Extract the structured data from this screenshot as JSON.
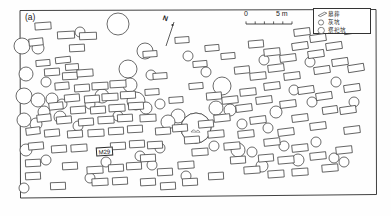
{
  "figure": {
    "panel_label": "(a)",
    "type": "archaeological-site-plan"
  },
  "north_arrow": {
    "label": "N",
    "name": "north-arrow"
  },
  "scale_bar": {
    "start_label": "0",
    "end_label": "5 m",
    "units": "m",
    "length_value": 5
  },
  "legend": {
    "items": [
      {
        "symbol": "rectangle",
        "label": "墓葬"
      },
      {
        "symbol": "circle-small",
        "label": "灰坑"
      },
      {
        "symbol": "circle-large",
        "label": "祭祀坑"
      }
    ]
  },
  "annotations": [
    {
      "id": "M29",
      "label": "M29"
    }
  ],
  "colors": {
    "stroke": "#3a3a3a",
    "frame": "#2b2b2b",
    "fill": "#ffffff",
    "background": "#fefefe",
    "hatch": "#555555"
  },
  "chart_data": {
    "type": "map",
    "title": "",
    "frame": {
      "x": 20,
      "y": 10,
      "width": 356,
      "height": 188
    },
    "tombs": [
      {
        "x": 43,
        "y": 26,
        "w": 16,
        "h": 7,
        "r": -4
      },
      {
        "x": 66,
        "y": 35,
        "w": 17,
        "h": 7,
        "r": -3
      },
      {
        "x": 88,
        "y": 36,
        "w": 17,
        "h": 7,
        "r": -2
      },
      {
        "x": 36,
        "y": 42,
        "w": 14,
        "h": 7,
        "r": -6
      },
      {
        "x": 77,
        "y": 48,
        "w": 15,
        "h": 7,
        "r": -3
      },
      {
        "x": 43,
        "y": 63,
        "w": 14,
        "h": 6,
        "r": -5
      },
      {
        "x": 63,
        "y": 60,
        "w": 15,
        "h": 6,
        "r": -6
      },
      {
        "x": 72,
        "y": 67,
        "w": 13,
        "h": 6,
        "r": -4
      },
      {
        "x": 52,
        "y": 72,
        "w": 15,
        "h": 7,
        "r": -4
      },
      {
        "x": 70,
        "y": 76,
        "w": 15,
        "h": 7,
        "r": -3
      },
      {
        "x": 85,
        "y": 73,
        "w": 16,
        "h": 7,
        "r": -4
      },
      {
        "x": 62,
        "y": 86,
        "w": 14,
        "h": 7,
        "r": -5
      },
      {
        "x": 82,
        "y": 88,
        "w": 15,
        "h": 7,
        "r": -4
      },
      {
        "x": 100,
        "y": 86,
        "w": 16,
        "h": 7,
        "r": -3
      },
      {
        "x": 118,
        "y": 84,
        "w": 16,
        "h": 7,
        "r": -3
      },
      {
        "x": 72,
        "y": 98,
        "w": 15,
        "h": 7,
        "r": -5
      },
      {
        "x": 92,
        "y": 99,
        "w": 15,
        "h": 7,
        "r": -4
      },
      {
        "x": 110,
        "y": 97,
        "w": 16,
        "h": 7,
        "r": -3
      },
      {
        "x": 128,
        "y": 95,
        "w": 15,
        "h": 7,
        "r": -3
      },
      {
        "x": 56,
        "y": 106,
        "w": 14,
        "h": 7,
        "r": -6
      },
      {
        "x": 78,
        "y": 110,
        "w": 15,
        "h": 7,
        "r": -4
      },
      {
        "x": 98,
        "y": 110,
        "w": 15,
        "h": 7,
        "r": -4
      },
      {
        "x": 117,
        "y": 108,
        "w": 16,
        "h": 7,
        "r": -3
      },
      {
        "x": 136,
        "y": 106,
        "w": 15,
        "h": 7,
        "r": -3
      },
      {
        "x": 44,
        "y": 118,
        "w": 14,
        "h": 7,
        "r": -6
      },
      {
        "x": 64,
        "y": 120,
        "w": 15,
        "h": 7,
        "r": -5
      },
      {
        "x": 86,
        "y": 122,
        "w": 15,
        "h": 7,
        "r": -4
      },
      {
        "x": 106,
        "y": 120,
        "w": 16,
        "h": 7,
        "r": -3
      },
      {
        "x": 125,
        "y": 118,
        "w": 15,
        "h": 7,
        "r": -3
      },
      {
        "x": 33,
        "y": 131,
        "w": 14,
        "h": 7,
        "r": -7
      },
      {
        "x": 52,
        "y": 133,
        "w": 15,
        "h": 7,
        "r": -5
      },
      {
        "x": 75,
        "y": 134,
        "w": 15,
        "h": 7,
        "r": -4
      },
      {
        "x": 96,
        "y": 133,
        "w": 16,
        "h": 7,
        "r": -3
      },
      {
        "x": 116,
        "y": 131,
        "w": 15,
        "h": 7,
        "r": -3
      },
      {
        "x": 135,
        "y": 129,
        "w": 15,
        "h": 7,
        "r": -3
      },
      {
        "x": 36,
        "y": 146,
        "w": 15,
        "h": 7,
        "r": -5
      },
      {
        "x": 59,
        "y": 149,
        "w": 15,
        "h": 7,
        "r": -4
      },
      {
        "x": 79,
        "y": 148,
        "w": 16,
        "h": 7,
        "r": -4
      },
      {
        "x": 118,
        "y": 146,
        "w": 15,
        "h": 7,
        "r": -3
      },
      {
        "x": 137,
        "y": 144,
        "w": 15,
        "h": 7,
        "r": -3
      },
      {
        "x": 33,
        "y": 163,
        "w": 15,
        "h": 7,
        "r": -3
      },
      {
        "x": 33,
        "y": 176,
        "w": 15,
        "h": 7,
        "r": -3
      },
      {
        "x": 70,
        "y": 166,
        "w": 15,
        "h": 7,
        "r": -3
      },
      {
        "x": 95,
        "y": 170,
        "w": 16,
        "h": 7,
        "r": -3
      },
      {
        "x": 116,
        "y": 168,
        "w": 15,
        "h": 7,
        "r": -3
      },
      {
        "x": 134,
        "y": 166,
        "w": 15,
        "h": 7,
        "r": -3
      },
      {
        "x": 100,
        "y": 182,
        "w": 16,
        "h": 7,
        "r": -3
      },
      {
        "x": 120,
        "y": 181,
        "w": 15,
        "h": 7,
        "r": -3
      },
      {
        "x": 150,
        "y": 54,
        "w": 14,
        "h": 6,
        "r": -4
      },
      {
        "x": 160,
        "y": 76,
        "w": 14,
        "h": 6,
        "r": -4
      },
      {
        "x": 152,
        "y": 92,
        "w": 14,
        "h": 6,
        "r": -4
      },
      {
        "x": 148,
        "y": 118,
        "w": 16,
        "h": 7,
        "r": -3
      },
      {
        "x": 163,
        "y": 131,
        "w": 15,
        "h": 7,
        "r": -4
      },
      {
        "x": 155,
        "y": 145,
        "w": 15,
        "h": 7,
        "r": -3
      },
      {
        "x": 148,
        "y": 158,
        "w": 15,
        "h": 7,
        "r": -3
      },
      {
        "x": 165,
        "y": 172,
        "w": 15,
        "h": 7,
        "r": -3
      },
      {
        "x": 186,
        "y": 165,
        "w": 16,
        "h": 7,
        "r": -4
      },
      {
        "x": 200,
        "y": 152,
        "w": 16,
        "h": 7,
        "r": -4
      },
      {
        "x": 192,
        "y": 140,
        "w": 15,
        "h": 7,
        "r": -4
      },
      {
        "x": 180,
        "y": 128,
        "w": 15,
        "h": 7,
        "r": -4
      },
      {
        "x": 206,
        "y": 124,
        "w": 15,
        "h": 7,
        "r": -5
      },
      {
        "x": 222,
        "y": 118,
        "w": 16,
        "h": 7,
        "r": -6
      },
      {
        "x": 216,
        "y": 134,
        "w": 16,
        "h": 7,
        "r": -5
      },
      {
        "x": 232,
        "y": 146,
        "w": 16,
        "h": 7,
        "r": -5
      },
      {
        "x": 246,
        "y": 134,
        "w": 16,
        "h": 7,
        "r": -6
      },
      {
        "x": 258,
        "y": 120,
        "w": 16,
        "h": 7,
        "r": -7
      },
      {
        "x": 244,
        "y": 108,
        "w": 16,
        "h": 7,
        "r": -7
      },
      {
        "x": 230,
        "y": 100,
        "w": 16,
        "h": 7,
        "r": -6
      },
      {
        "x": 248,
        "y": 92,
        "w": 16,
        "h": 7,
        "r": -6
      },
      {
        "x": 264,
        "y": 100,
        "w": 16,
        "h": 7,
        "r": -7
      },
      {
        "x": 272,
        "y": 86,
        "w": 16,
        "h": 7,
        "r": -7
      },
      {
        "x": 258,
        "y": 76,
        "w": 16,
        "h": 7,
        "r": -6
      },
      {
        "x": 242,
        "y": 70,
        "w": 15,
        "h": 7,
        "r": -6
      },
      {
        "x": 276,
        "y": 68,
        "w": 16,
        "h": 7,
        "r": -7
      },
      {
        "x": 292,
        "y": 76,
        "w": 16,
        "h": 7,
        "r": -7
      },
      {
        "x": 288,
        "y": 58,
        "w": 16,
        "h": 7,
        "r": -7
      },
      {
        "x": 272,
        "y": 52,
        "w": 16,
        "h": 7,
        "r": -6
      },
      {
        "x": 256,
        "y": 44,
        "w": 15,
        "h": 7,
        "r": -5
      },
      {
        "x": 300,
        "y": 46,
        "w": 16,
        "h": 7,
        "r": -8
      },
      {
        "x": 316,
        "y": 54,
        "w": 16,
        "h": 7,
        "r": -8
      },
      {
        "x": 318,
        "y": 38,
        "w": 16,
        "h": 7,
        "r": -8
      },
      {
        "x": 302,
        "y": 32,
        "w": 16,
        "h": 7,
        "r": -7
      },
      {
        "x": 334,
        "y": 46,
        "w": 16,
        "h": 7,
        "r": -8
      },
      {
        "x": 340,
        "y": 62,
        "w": 16,
        "h": 7,
        "r": -8
      },
      {
        "x": 322,
        "y": 70,
        "w": 16,
        "h": 7,
        "r": -8
      },
      {
        "x": 306,
        "y": 90,
        "w": 16,
        "h": 7,
        "r": -8
      },
      {
        "x": 324,
        "y": 96,
        "w": 16,
        "h": 7,
        "r": -8
      },
      {
        "x": 288,
        "y": 104,
        "w": 16,
        "h": 7,
        "r": -7
      },
      {
        "x": 300,
        "y": 118,
        "w": 16,
        "h": 7,
        "r": -7
      },
      {
        "x": 318,
        "y": 126,
        "w": 16,
        "h": 7,
        "r": -7
      },
      {
        "x": 286,
        "y": 132,
        "w": 16,
        "h": 7,
        "r": -7
      },
      {
        "x": 272,
        "y": 142,
        "w": 16,
        "h": 7,
        "r": -6
      },
      {
        "x": 300,
        "y": 148,
        "w": 16,
        "h": 7,
        "r": -6
      },
      {
        "x": 318,
        "y": 156,
        "w": 16,
        "h": 7,
        "r": -6
      },
      {
        "x": 286,
        "y": 160,
        "w": 16,
        "h": 7,
        "r": -5
      },
      {
        "x": 266,
        "y": 158,
        "w": 15,
        "h": 7,
        "r": -5
      },
      {
        "x": 252,
        "y": 170,
        "w": 16,
        "h": 7,
        "r": -4
      },
      {
        "x": 276,
        "y": 174,
        "w": 16,
        "h": 7,
        "r": -4
      },
      {
        "x": 300,
        "y": 172,
        "w": 16,
        "h": 7,
        "r": -4
      },
      {
        "x": 330,
        "y": 168,
        "w": 16,
        "h": 7,
        "r": -5
      },
      {
        "x": 344,
        "y": 150,
        "w": 16,
        "h": 7,
        "r": -6
      },
      {
        "x": 352,
        "y": 130,
        "w": 16,
        "h": 7,
        "r": -7
      },
      {
        "x": 348,
        "y": 110,
        "w": 16,
        "h": 7,
        "r": -8
      },
      {
        "x": 352,
        "y": 88,
        "w": 16,
        "h": 7,
        "r": -8
      },
      {
        "x": 356,
        "y": 68,
        "w": 16,
        "h": 7,
        "r": -9
      },
      {
        "x": 352,
        "y": 30,
        "w": 16,
        "h": 7,
        "r": -9
      },
      {
        "x": 200,
        "y": 64,
        "w": 14,
        "h": 6,
        "r": -5
      },
      {
        "x": 212,
        "y": 48,
        "w": 14,
        "h": 6,
        "r": -5
      },
      {
        "x": 182,
        "y": 40,
        "w": 14,
        "h": 6,
        "r": -4
      },
      {
        "x": 196,
        "y": 86,
        "w": 14,
        "h": 6,
        "r": -5
      },
      {
        "x": 176,
        "y": 100,
        "w": 14,
        "h": 6,
        "r": -4
      },
      {
        "x": 214,
        "y": 96,
        "w": 15,
        "h": 7,
        "r": -5
      },
      {
        "x": 228,
        "y": 56,
        "w": 14,
        "h": 6,
        "r": -5
      },
      {
        "x": 238,
        "y": 160,
        "w": 15,
        "h": 7,
        "r": -4
      },
      {
        "x": 216,
        "y": 176,
        "w": 15,
        "h": 7,
        "r": -3
      },
      {
        "x": 190,
        "y": 182,
        "w": 15,
        "h": 7,
        "r": -3
      },
      {
        "x": 168,
        "y": 186,
        "w": 15,
        "h": 7,
        "r": -3
      },
      {
        "x": 148,
        "y": 182,
        "w": 15,
        "h": 7,
        "r": -3
      },
      {
        "x": 58,
        "y": 186,
        "w": 15,
        "h": 7,
        "r": -2
      },
      {
        "x": 330,
        "y": 110,
        "w": 15,
        "h": 7,
        "r": -8
      }
    ],
    "pits": [
      {
        "x": 118,
        "y": 24,
        "r": 11
      },
      {
        "x": 80,
        "y": 32,
        "r": 5
      },
      {
        "x": 22,
        "y": 46,
        "r": 8
      },
      {
        "x": 38,
        "y": 48,
        "r": 6
      },
      {
        "x": 145,
        "y": 51,
        "r": 8
      },
      {
        "x": 128,
        "y": 69,
        "r": 9
      },
      {
        "x": 130,
        "y": 85,
        "r": 7
      },
      {
        "x": 151,
        "y": 75,
        "r": 5
      },
      {
        "x": 26,
        "y": 74,
        "r": 7
      },
      {
        "x": 46,
        "y": 82,
        "r": 5
      },
      {
        "x": 24,
        "y": 96,
        "r": 8
      },
      {
        "x": 38,
        "y": 100,
        "r": 7
      },
      {
        "x": 52,
        "y": 99,
        "r": 6
      },
      {
        "x": 62,
        "y": 104,
        "r": 5
      },
      {
        "x": 44,
        "y": 112,
        "r": 6
      },
      {
        "x": 36,
        "y": 124,
        "r": 6
      },
      {
        "x": 24,
        "y": 120,
        "r": 7
      },
      {
        "x": 60,
        "y": 117,
        "r": 6
      },
      {
        "x": 102,
        "y": 96,
        "r": 7
      },
      {
        "x": 90,
        "y": 104,
        "r": 5
      },
      {
        "x": 136,
        "y": 101,
        "r": 9
      },
      {
        "x": 146,
        "y": 108,
        "r": 6
      },
      {
        "x": 160,
        "y": 104,
        "r": 5
      },
      {
        "x": 118,
        "y": 116,
        "r": 5
      },
      {
        "x": 78,
        "y": 126,
        "r": 5
      },
      {
        "x": 46,
        "y": 160,
        "r": 5
      },
      {
        "x": 26,
        "y": 150,
        "r": 6
      },
      {
        "x": 24,
        "y": 188,
        "r": 5
      },
      {
        "x": 106,
        "y": 162,
        "r": 5
      },
      {
        "x": 152,
        "y": 165,
        "r": 5
      },
      {
        "x": 178,
        "y": 116,
        "r": 7
      },
      {
        "x": 168,
        "y": 122,
        "r": 7
      },
      {
        "x": 196,
        "y": 128,
        "r": 15
      },
      {
        "x": 206,
        "y": 72,
        "r": 5
      },
      {
        "x": 188,
        "y": 56,
        "r": 5
      },
      {
        "x": 230,
        "y": 110,
        "r": 6
      },
      {
        "x": 222,
        "y": 86,
        "r": 9
      },
      {
        "x": 216,
        "y": 108,
        "r": 7
      },
      {
        "x": 238,
        "y": 150,
        "r": 7
      },
      {
        "x": 214,
        "y": 146,
        "r": 5
      },
      {
        "x": 252,
        "y": 152,
        "r": 5
      },
      {
        "x": 262,
        "y": 166,
        "r": 6
      },
      {
        "x": 276,
        "y": 112,
        "r": 6
      },
      {
        "x": 268,
        "y": 128,
        "r": 5
      },
      {
        "x": 284,
        "y": 146,
        "r": 5
      },
      {
        "x": 298,
        "y": 160,
        "r": 6
      },
      {
        "x": 316,
        "y": 142,
        "r": 5
      },
      {
        "x": 334,
        "y": 158,
        "r": 5
      },
      {
        "x": 344,
        "y": 162,
        "r": 5
      },
      {
        "x": 312,
        "y": 102,
        "r": 5
      },
      {
        "x": 294,
        "y": 90,
        "r": 5
      },
      {
        "x": 336,
        "y": 82,
        "r": 5
      },
      {
        "x": 354,
        "y": 102,
        "r": 5
      },
      {
        "x": 310,
        "y": 62,
        "r": 5
      },
      {
        "x": 264,
        "y": 60,
        "r": 5
      },
      {
        "x": 242,
        "y": 124,
        "r": 5
      },
      {
        "x": 160,
        "y": 148,
        "r": 5
      },
      {
        "x": 140,
        "y": 156,
        "r": 5
      },
      {
        "x": 90,
        "y": 178,
        "r": 5
      },
      {
        "x": 186,
        "y": 176,
        "r": 5
      }
    ],
    "sacrificial_pit": {
      "x": 196,
      "y": 128,
      "r": 15,
      "hatched": true
    },
    "marked_tomb": {
      "id": "M29",
      "x": 104,
      "y": 150
    }
  }
}
